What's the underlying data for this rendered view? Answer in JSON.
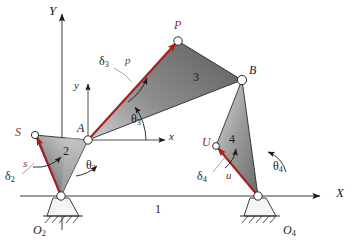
{
  "figure": {
    "type": "fourbar-linkage-kinematic-diagram"
  },
  "colors": {
    "vector_red": "#a61f1f",
    "label_red": "#8c2b2b",
    "outline": "#1a1a1a",
    "link_fill_light": "#e8e8e8",
    "link_fill_dark": "#6e6e6e",
    "axis": "#3a3a3a",
    "leader": "#808080"
  },
  "axes": {
    "global_x_label": "X",
    "global_y_label": "Y",
    "local_x_label": "x",
    "local_y_label": "y"
  },
  "joints": [
    {
      "name": "O2",
      "label": "O",
      "subscript": "2",
      "x": 61,
      "y": 196,
      "kind": "ground-pivot"
    },
    {
      "name": "O4",
      "label": "O",
      "subscript": "4",
      "x": 258,
      "y": 196,
      "kind": "ground-pivot"
    },
    {
      "name": "A",
      "label": "A",
      "subscript": "",
      "x": 88,
      "y": 140,
      "kind": "pin"
    },
    {
      "name": "B",
      "label": "B",
      "subscript": "",
      "x": 242,
      "y": 80,
      "kind": "pin"
    },
    {
      "name": "P",
      "label": "P",
      "subscript": "",
      "x": 178,
      "y": 41,
      "kind": "coupler-point"
    },
    {
      "name": "S",
      "label": "S",
      "subscript": "",
      "x": 35,
      "y": 135,
      "kind": "body-point"
    },
    {
      "name": "U",
      "label": "U",
      "subscript": "",
      "x": 216,
      "y": 146,
      "kind": "body-point"
    }
  ],
  "links": [
    {
      "number": "1",
      "name": "ground-link",
      "label_x": 158,
      "label_y": 210
    },
    {
      "number": "2",
      "name": "crank-link",
      "label_x": 66,
      "label_y": 152
    },
    {
      "number": "3",
      "name": "coupler-link",
      "label_x": 196,
      "label_y": 78
    },
    {
      "number": "4",
      "name": "rocker-link",
      "label_x": 232,
      "label_y": 140
    }
  ],
  "vectors": [
    {
      "name": "s",
      "label": "s",
      "from": "O2",
      "to": "S",
      "label_x": 26,
      "label_y": 165
    },
    {
      "name": "p",
      "label": "p",
      "from": "A",
      "to": "P",
      "label_x": 128,
      "label_y": 62
    },
    {
      "name": "u",
      "label": "u",
      "from": "O4",
      "to": "U",
      "label_x": 229,
      "label_y": 177
    }
  ],
  "angles": [
    {
      "name": "theta2",
      "glyph": "θ",
      "subscript": "2",
      "label_x": 89,
      "label_y": 166
    },
    {
      "name": "theta3",
      "glyph": "θ",
      "subscript": "3",
      "label_x": 134,
      "label_y": 120
    },
    {
      "name": "theta4",
      "glyph": "θ",
      "subscript": "4",
      "label_x": 276,
      "label_y": 167
    },
    {
      "name": "delta2",
      "glyph": "δ",
      "subscript": "2",
      "label_x": 8,
      "label_y": 177
    },
    {
      "name": "delta3",
      "glyph": "δ",
      "subscript": "3",
      "label_x": 102,
      "label_y": 62
    },
    {
      "name": "delta4",
      "glyph": "δ",
      "subscript": "4",
      "label_x": 200,
      "label_y": 177
    }
  ]
}
